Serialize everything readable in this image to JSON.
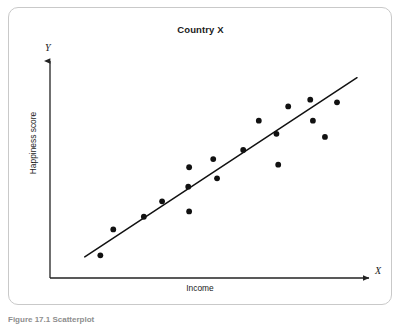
{
  "figure": {
    "caption": "Figure 17.1 Scatterplot"
  },
  "chart": {
    "title": "Country X",
    "xlabel": "Income",
    "ylabel": "Happiness score",
    "x_axis_letter": "X",
    "y_axis_letter": "Y",
    "colors": {
      "point": "#111111",
      "line": "#111111",
      "axis": "#333333",
      "frame": "#c9c9c9",
      "background": "#ffffff"
    }
  },
  "chart_data": {
    "type": "scatter",
    "title": "Country X",
    "xlabel": "Income",
    "ylabel": "Happiness score",
    "grid": false,
    "legend": null,
    "xlim": [
      0,
      100
    ],
    "ylim": [
      0,
      100
    ],
    "axis_tick_labels": {
      "x": [],
      "y": []
    },
    "annotations": [
      {
        "text": "X",
        "role": "x-axis-arrow-label"
      },
      {
        "text": "Y",
        "role": "y-axis-arrow-label"
      }
    ],
    "points": [
      {
        "x": 12.7,
        "y": 7.4
      },
      {
        "x": 17.1,
        "y": 20.5
      },
      {
        "x": 27.5,
        "y": 26.9
      },
      {
        "x": 33.7,
        "y": 34.7
      },
      {
        "x": 42.6,
        "y": 42.1
      },
      {
        "x": 42.9,
        "y": 51.9
      },
      {
        "x": 42.9,
        "y": 29.6
      },
      {
        "x": 51.1,
        "y": 56.0
      },
      {
        "x": 52.4,
        "y": 46.3
      },
      {
        "x": 61.3,
        "y": 60.6
      },
      {
        "x": 66.6,
        "y": 75.4
      },
      {
        "x": 72.6,
        "y": 68.8
      },
      {
        "x": 73.2,
        "y": 53.2
      },
      {
        "x": 76.6,
        "y": 82.6
      },
      {
        "x": 84.1,
        "y": 86.0
      },
      {
        "x": 85.0,
        "y": 75.4
      },
      {
        "x": 89.1,
        "y": 67.2
      },
      {
        "x": 93.2,
        "y": 84.7
      }
    ],
    "trendline": {
      "type": "linear-fit",
      "x_start": 7.4,
      "y_start": 6.6,
      "x_end": 100.0,
      "y_end": 97.1
    },
    "series": [
      {
        "name": "Country X observations",
        "x": [
          12.7,
          17.1,
          27.5,
          33.7,
          42.6,
          42.9,
          42.9,
          51.1,
          52.4,
          61.3,
          66.6,
          72.6,
          73.2,
          76.6,
          84.1,
          85.0,
          89.1,
          93.2
        ],
        "y": [
          7.4,
          20.5,
          26.9,
          34.7,
          42.1,
          51.9,
          29.6,
          56.0,
          46.3,
          60.6,
          75.4,
          68.8,
          53.2,
          82.6,
          86.0,
          75.4,
          67.2,
          84.7
        ]
      }
    ]
  }
}
